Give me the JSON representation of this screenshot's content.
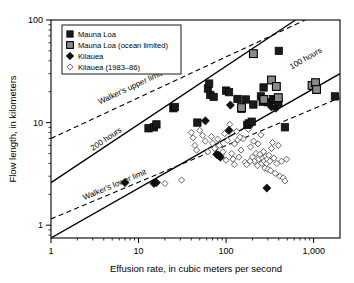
{
  "chart_data": {
    "type": "scatter",
    "title": "",
    "xlabel": "Effusion rate, in cubic meters per second",
    "ylabel": "Flow length, in kilometers",
    "xscale": "log",
    "yscale": "log",
    "xlim": [
      1,
      2000
    ],
    "ylim": [
      0.75,
      100
    ],
    "grid": false,
    "legend_position": "top-left",
    "xticks": [
      1,
      10,
      100,
      1000
    ],
    "xtick_labels": [
      "1",
      "10",
      "100",
      "1,000"
    ],
    "yticks": [
      1,
      10,
      100
    ],
    "ytick_labels": [
      "1",
      "10",
      "100"
    ],
    "series": [
      {
        "name": "Mauna Loa",
        "marker": "filled-square-black",
        "color": "#1a1a1a",
        "points": [
          [
            13,
            8.8
          ],
          [
            15,
            9.0
          ],
          [
            16,
            9.6
          ],
          [
            25,
            13.8
          ],
          [
            26,
            14.2
          ],
          [
            62,
            21.5
          ],
          [
            64,
            24.0
          ],
          [
            66,
            18.6
          ],
          [
            72,
            17.8
          ],
          [
            100,
            20.5
          ],
          [
            108,
            19.8
          ],
          [
            135,
            17.0
          ],
          [
            150,
            13.6
          ],
          [
            168,
            16.8
          ],
          [
            205,
            15.0
          ],
          [
            250,
            18.0
          ],
          [
            262,
            16.0
          ],
          [
            268,
            22.0
          ],
          [
            300,
            15.8
          ],
          [
            345,
            17.0
          ],
          [
            370,
            16.5
          ],
          [
            395,
            15.6
          ],
          [
            400,
            50.0
          ],
          [
            470,
            9.0
          ],
          [
            1750,
            18.0
          ],
          [
            47,
            10.0
          ],
          [
            175,
            9.5
          ],
          [
            182,
            9.8
          ],
          [
            196,
            10.2
          ]
        ]
      },
      {
        "name": "Mauna Loa (ocean limited)",
        "marker": "filled-square-gray",
        "color": "#8a8a8a",
        "points": [
          [
            205,
            47.0
          ],
          [
            150,
            14.0
          ],
          [
            330,
            26.0
          ],
          [
            375,
            22.5
          ],
          [
            395,
            17.5
          ],
          [
            960,
            23.0
          ],
          [
            1050,
            24.5
          ],
          [
            1080,
            21.0
          ],
          [
            270,
            16.8
          ]
        ]
      },
      {
        "name": "Kilauea",
        "marker": "filled-diamond-black",
        "color": "#111111",
        "points": [
          [
            7,
            2.6
          ],
          [
            15,
            2.55
          ],
          [
            16,
            2.6
          ],
          [
            58,
            10.4
          ],
          [
            78,
            4.9
          ],
          [
            82,
            4.8
          ],
          [
            86,
            4.6
          ],
          [
            112,
            14.8
          ],
          [
            330,
            14.2
          ],
          [
            370,
            13.8
          ],
          [
            292,
            2.3
          ],
          [
            108,
            8.4
          ]
        ]
      },
      {
        "name": "Kilauea (1983–86)",
        "marker": "open-diamond",
        "color": "#ffffff",
        "points": [
          [
            20,
            2.55
          ],
          [
            31,
            2.75
          ],
          [
            40,
            8.0
          ],
          [
            42,
            7.1
          ],
          [
            44,
            6.0
          ],
          [
            46,
            5.4
          ],
          [
            50,
            8.4
          ],
          [
            54,
            7.5
          ],
          [
            58,
            6.6
          ],
          [
            62,
            5.2
          ],
          [
            68,
            7.3
          ],
          [
            70,
            6.3
          ],
          [
            74,
            5.6
          ],
          [
            80,
            6.9
          ],
          [
            84,
            6.0
          ],
          [
            88,
            4.9
          ],
          [
            92,
            5.2
          ],
          [
            96,
            7.8
          ],
          [
            100,
            4.3
          ],
          [
            104,
            6.7
          ],
          [
            110,
            9.6
          ],
          [
            116,
            5.0
          ],
          [
            120,
            4.4
          ],
          [
            125,
            6.2
          ],
          [
            132,
            8.2
          ],
          [
            140,
            4.6
          ],
          [
            148,
            5.4
          ],
          [
            156,
            7.0
          ],
          [
            165,
            4.1
          ],
          [
            172,
            3.9
          ],
          [
            180,
            8.6
          ],
          [
            190,
            5.8
          ],
          [
            200,
            4.6
          ],
          [
            210,
            4.2
          ],
          [
            220,
            5.0
          ],
          [
            228,
            3.8
          ],
          [
            236,
            4.4
          ],
          [
            244,
            4.9
          ],
          [
            250,
            7.6
          ],
          [
            256,
            4.0
          ],
          [
            262,
            4.5
          ],
          [
            268,
            5.2
          ],
          [
            272,
            4.2
          ],
          [
            278,
            3.6
          ],
          [
            284,
            4.7
          ],
          [
            290,
            4.0
          ],
          [
            296,
            4.4
          ],
          [
            302,
            3.5
          ],
          [
            308,
            4.8
          ],
          [
            316,
            4.2
          ],
          [
            322,
            3.4
          ],
          [
            330,
            5.6
          ],
          [
            340,
            6.4
          ],
          [
            352,
            4.5
          ],
          [
            364,
            3.2
          ],
          [
            380,
            4.0
          ],
          [
            396,
            6.0
          ],
          [
            410,
            3.0
          ],
          [
            430,
            4.2
          ],
          [
            450,
            2.9
          ],
          [
            470,
            2.7
          ],
          [
            490,
            4.4
          ],
          [
            136,
            6.8
          ],
          [
            144,
            7.2
          ],
          [
            124,
            3.9
          ],
          [
            232,
            6.2
          ],
          [
            206,
            6.6
          ],
          [
            188,
            4.2
          ]
        ]
      }
    ],
    "reference_lines": [
      {
        "label": "Walker's upper limit",
        "style": "dashed",
        "label_x": 3.6,
        "label_y": 15.0,
        "endpoints": [
          [
            1,
            7.0
          ],
          [
            800,
            100
          ]
        ]
      },
      {
        "label": "200 hours",
        "style": "solid",
        "label_x": 3.0,
        "label_y": 5.3,
        "endpoints": [
          [
            1,
            2.6
          ],
          [
            620,
            100
          ]
        ]
      },
      {
        "label": "100 hours",
        "style": "solid",
        "label_x": 560,
        "label_y": 33.0,
        "endpoints": [
          [
            1,
            0.75
          ],
          [
            2000,
            30.0
          ]
        ]
      },
      {
        "label": "Walker's lower limit",
        "style": "dashed",
        "label_x": 2.4,
        "label_y": 1.75,
        "endpoints": [
          [
            1,
            1.15
          ],
          [
            2000,
            17.5
          ]
        ]
      }
    ]
  },
  "legend": {
    "entries": [
      {
        "label": "Mauna Loa",
        "marker": "filled-square-black"
      },
      {
        "label": "Mauna Loa (ocean limited)",
        "marker": "filled-square-gray"
      },
      {
        "label": "Kilauea",
        "marker": "filled-diamond-black"
      },
      {
        "label": "Kilauea (1983–86)",
        "marker": "open-diamond"
      }
    ]
  },
  "colors": {
    "mauna_loa": "#1a1a1a",
    "mauna_loa_ocean": "#8a8a8a",
    "kilauea": "#111111",
    "kilauea_1983_86": "#ffffff",
    "axis": "#000000",
    "background": "#ffffff"
  }
}
